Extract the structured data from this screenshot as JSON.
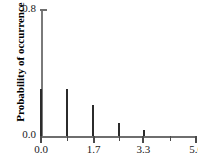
{
  "chart_data": {
    "type": "bar",
    "title": "",
    "subtitle": "",
    "xlabel": "",
    "ylabel": "Probability of occurrence",
    "xlim": [
      0.0,
      5.0
    ],
    "ylim": [
      0.0,
      0.8
    ],
    "grid": false,
    "legend": null,
    "x_ticks": [
      {
        "value": 0.0,
        "label": "0.0",
        "type": "major"
      },
      {
        "value": 0.83,
        "label": "",
        "type": "minor"
      },
      {
        "value": 1.7,
        "label": "1.7",
        "type": "major"
      },
      {
        "value": 2.5,
        "label": "",
        "type": "minor"
      },
      {
        "value": 3.3,
        "label": "3.3",
        "type": "major"
      },
      {
        "value": 4.15,
        "label": "",
        "type": "minor"
      },
      {
        "value": 5.0,
        "label": "5.0",
        "type": "major"
      }
    ],
    "y_ticks": [
      {
        "value": 0.8,
        "label": "0.8"
      },
      {
        "value": 0.0,
        "label": "0.0"
      }
    ],
    "categories": [
      "0.0",
      "0.83",
      "1.67",
      "2.50",
      "3.33"
    ],
    "x": [
      0.0,
      0.83,
      1.67,
      2.5,
      3.33
    ],
    "values": [
      0.3,
      0.3,
      0.2,
      0.085,
      0.04
    ],
    "series": [
      {
        "name": "Probability of occurrence",
        "color": "#2b2b2b",
        "values": [
          0.3,
          0.3,
          0.2,
          0.085,
          0.04
        ]
      }
    ],
    "bar_style": "impulse",
    "colors": {
      "bar": "#2b2b2b",
      "axis": "#6e6e6e",
      "text": "#1a1a1a",
      "background": "#ffffff"
    }
  }
}
